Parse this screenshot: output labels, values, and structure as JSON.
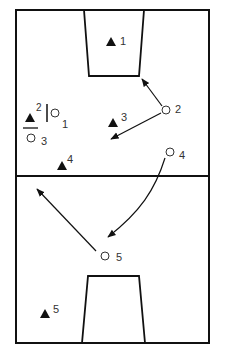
{
  "diagram": {
    "type": "basketball-play",
    "colors": {
      "line": "#111111",
      "text": "#333333",
      "background": "#ffffff"
    },
    "defenders": [
      {
        "id": "defender-1",
        "label": "1",
        "shape": "triangle"
      },
      {
        "id": "defender-2",
        "label": "2",
        "shape": "triangle"
      },
      {
        "id": "defender-3",
        "label": "3",
        "shape": "triangle"
      },
      {
        "id": "defender-4",
        "label": "4",
        "shape": "triangle"
      },
      {
        "id": "defender-5",
        "label": "5",
        "shape": "triangle"
      }
    ],
    "offense": [
      {
        "id": "offense-1",
        "label": "1",
        "shape": "circle"
      },
      {
        "id": "offense-2",
        "label": "2",
        "shape": "circle"
      },
      {
        "id": "offense-3",
        "label": "3",
        "shape": "circle"
      },
      {
        "id": "offense-4",
        "label": "4",
        "shape": "circle"
      },
      {
        "id": "offense-5",
        "label": "5",
        "shape": "circle"
      }
    ],
    "movements": [
      {
        "from": "offense-2",
        "to": "key-top-corner",
        "type": "straight-arrow"
      },
      {
        "from": "offense-2",
        "to": "defender-3-area",
        "type": "straight-arrow"
      },
      {
        "from": "offense-4",
        "to": "offense-5-area",
        "type": "curved-arrow"
      },
      {
        "from": "offense-5",
        "to": "backcourt-left",
        "type": "straight-arrow"
      }
    ]
  }
}
